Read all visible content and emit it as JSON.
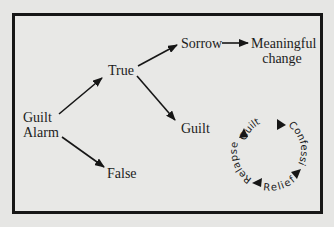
{
  "diagram": {
    "nodes": {
      "guilt_alarm": {
        "line1": "Guilt",
        "line2": "Alarm"
      },
      "true": "True",
      "false": "False",
      "sorrow": "Sorrow",
      "meaningful_change": {
        "line1": "Meaningful",
        "line2": "change"
      },
      "guilt": "Guilt"
    },
    "edges": [
      {
        "from": "Guilt Alarm",
        "to": "True"
      },
      {
        "from": "Guilt Alarm",
        "to": "False"
      },
      {
        "from": "True",
        "to": "Sorrow"
      },
      {
        "from": "True",
        "to": "Guilt"
      },
      {
        "from": "Sorrow",
        "to": "Meaningful change"
      }
    ],
    "cycle": {
      "items": [
        "Guilt",
        "Confession",
        "Relief",
        "Relapse"
      ]
    },
    "colors": {
      "background": "#e6e6e4",
      "ink": "#161616"
    }
  }
}
